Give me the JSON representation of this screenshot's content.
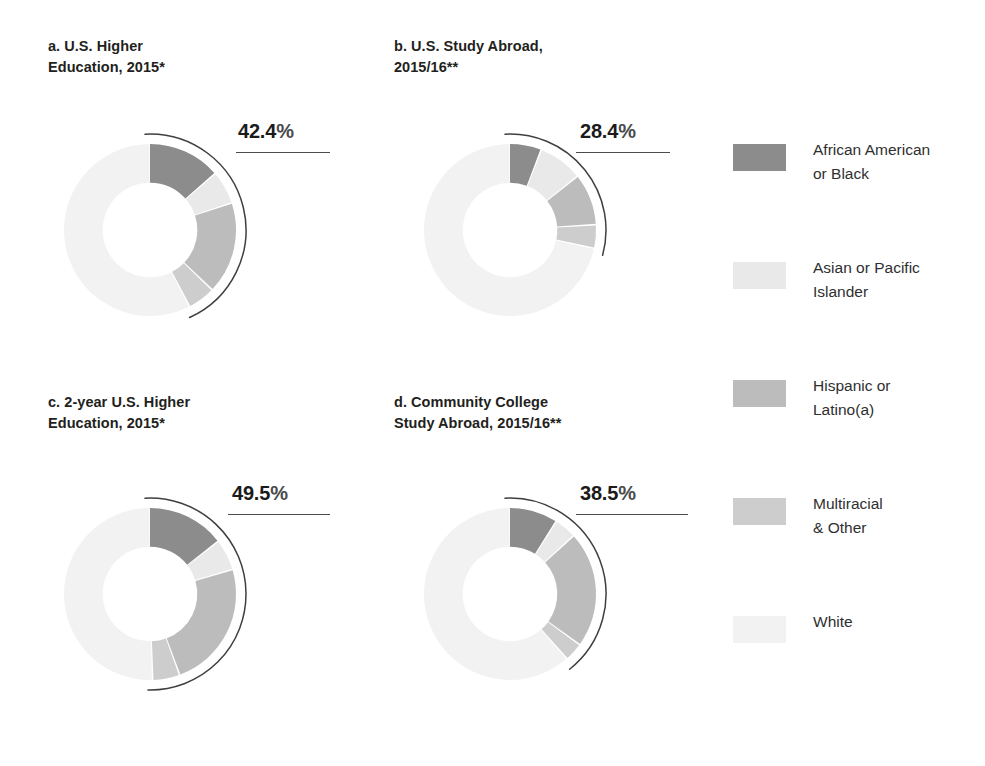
{
  "top_fragment": "",
  "colors": {
    "african_american": "#8c8c8c",
    "asian": "#e9e9e9",
    "hispanic": "#bcbcbc",
    "multiracial": "#cdcdcd",
    "white": "#f2f2f2",
    "arc_stroke": "#3f3f3f",
    "text": "#231f20"
  },
  "legend": {
    "items": [
      {
        "label": "African American\nor Black",
        "color": "#8c8c8c",
        "key": "african_american"
      },
      {
        "label": "Asian or Pacific\nIslander",
        "color": "#e9e9e9",
        "key": "asian"
      },
      {
        "label": "Hispanic or\nLatino(a)",
        "color": "#bcbcbc",
        "key": "hispanic"
      },
      {
        "label": "Multiracial\n& Other",
        "color": "#cdcdcd",
        "key": "multiracial"
      },
      {
        "label": "White",
        "color": "#f2f2f2",
        "key": "white"
      }
    ]
  },
  "panels": [
    {
      "id": "a",
      "title": "a.  U.S. Higher\nEducation, 2015*",
      "highlight_label": "42.4",
      "highlight_sign": "%",
      "highlight_value": 42.4
    },
    {
      "id": "b",
      "title": "b.  U.S. Study Abroad,\n2015/16**",
      "highlight_label": "28.4",
      "highlight_sign": "%",
      "highlight_value": 28.4
    },
    {
      "id": "c",
      "title": "c.  2-year U.S. Higher\nEducation, 2015*",
      "highlight_label": "49.5",
      "highlight_sign": "%",
      "highlight_value": 49.5
    },
    {
      "id": "d",
      "title": "d.  Community College\nStudy Abroad, 2015/16**",
      "highlight_label": "38.5",
      "highlight_sign": "%",
      "highlight_value": 38.5
    }
  ],
  "chart_data": [
    {
      "type": "pie",
      "id": "a",
      "title": "a.  U.S. Higher Education, 2015*",
      "annotation": "42.4%",
      "minority_total": 42.4,
      "categories": [
        "African American or Black",
        "Asian or Pacific Islander",
        "Hispanic or Latino(a)",
        "Multiracial & Other",
        "White"
      ],
      "values": [
        13.6,
        6.3,
        17.3,
        5.2,
        57.6
      ],
      "colors": [
        "#8c8c8c",
        "#e9e9e9",
        "#bcbcbc",
        "#cdcdcd",
        "#f2f2f2"
      ],
      "start_angle_deg": 0,
      "direction": "clockwise",
      "donut": true,
      "inner_radius_ratio": 0.55,
      "legend_position": "right"
    },
    {
      "type": "pie",
      "id": "b",
      "title": "b.  U.S. Study Abroad, 2015/16**",
      "annotation": "28.4%",
      "minority_total": 28.4,
      "categories": [
        "African American or Black",
        "Asian or Pacific Islander",
        "Hispanic or Latino(a)",
        "Multiracial & Other",
        "White"
      ],
      "values": [
        5.9,
        8.4,
        9.7,
        4.4,
        71.6
      ],
      "colors": [
        "#8c8c8c",
        "#e9e9e9",
        "#bcbcbc",
        "#cdcdcd",
        "#f2f2f2"
      ],
      "start_angle_deg": 0,
      "direction": "clockwise",
      "donut": true,
      "inner_radius_ratio": 0.55,
      "legend_position": "right"
    },
    {
      "type": "pie",
      "id": "c",
      "title": "c.  2-year U.S. Higher Education, 2015*",
      "annotation": "49.5%",
      "minority_total": 49.5,
      "categories": [
        "African American or Black",
        "Asian or Pacific Islander",
        "Hispanic or Latino(a)",
        "Multiracial & Other",
        "White"
      ],
      "values": [
        14.5,
        5.9,
        24.0,
        5.1,
        50.5
      ],
      "colors": [
        "#8c8c8c",
        "#e9e9e9",
        "#bcbcbc",
        "#cdcdcd",
        "#f2f2f2"
      ],
      "start_angle_deg": 0,
      "direction": "clockwise",
      "donut": true,
      "inner_radius_ratio": 0.55,
      "legend_position": "right"
    },
    {
      "type": "pie",
      "id": "d",
      "title": "d.  Community College Study Abroad, 2015/16**",
      "annotation": "38.5%",
      "minority_total": 38.5,
      "categories": [
        "African American or Black",
        "Asian or Pacific Islander",
        "Hispanic or Latino(a)",
        "Multiracial & Other",
        "White"
      ],
      "values": [
        9.0,
        4.2,
        21.8,
        3.5,
        61.5
      ],
      "colors": [
        "#8c8c8c",
        "#e9e9e9",
        "#bcbcbc",
        "#cdcdcd",
        "#f2f2f2"
      ],
      "start_angle_deg": 0,
      "direction": "clockwise",
      "donut": true,
      "inner_radius_ratio": 0.55,
      "legend_position": "right"
    }
  ]
}
